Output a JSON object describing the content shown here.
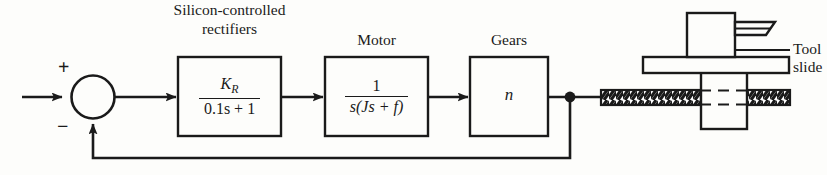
{
  "diagram": {
    "type": "control-system-block-diagram",
    "line_color": "#1a1a1a",
    "background": "#fdfdfb",
    "summing_junction": {
      "plus_sign": "+",
      "minus_sign": "−"
    },
    "blocks": [
      {
        "id": "scr",
        "caption_line1": "Silicon-controlled",
        "caption_line2": "rectifiers",
        "numerator": "K",
        "numerator_subscript": "R",
        "denominator": "0.1s + 1"
      },
      {
        "id": "motor",
        "caption": "Motor",
        "numerator": "1",
        "denominator_prefix": "s",
        "denominator_paren": "(Js + f)"
      },
      {
        "id": "gears",
        "caption": "Gears",
        "gain": "n"
      }
    ],
    "mechanism": {
      "label_line1": "Tool",
      "label_line2": "slide"
    }
  }
}
